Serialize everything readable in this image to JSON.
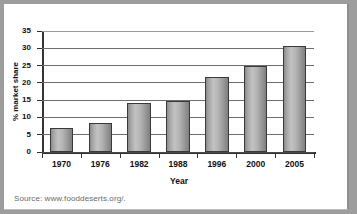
{
  "chart_data": {
    "type": "bar",
    "title": "",
    "xlabel": "Year",
    "ylabel": "% market share",
    "categories": [
      "1970",
      "1976",
      "1982",
      "1988",
      "1996",
      "2000",
      "2005"
    ],
    "values": [
      7,
      8.4,
      14.3,
      14.8,
      21.8,
      25,
      30.7
    ],
    "ylim": [
      0,
      35
    ],
    "ytick_labels": [
      "0",
      "5",
      "10",
      "15",
      "20",
      "25",
      "30",
      "35"
    ],
    "ytick_values": [
      0,
      5,
      10,
      15,
      20,
      25,
      30,
      35
    ],
    "grid": "horizontal",
    "legend": "none",
    "bar_color": "#aaaaaa",
    "bar_edge_color": "#3a3a3a",
    "axis_color": "#333333",
    "grid_color": "#6e6e6e",
    "frame_color": "#9d9d9d",
    "plot_background": "#ffffff"
  },
  "footer": {
    "source": "Source: www.fooddeserts.org/."
  }
}
